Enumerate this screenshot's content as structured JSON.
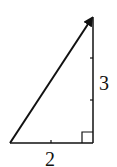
{
  "diagram": {
    "type": "right-triangle-vector",
    "colors": {
      "stroke": "#111111",
      "background": "#ffffff"
    },
    "horizontal_leg": {
      "label": "2"
    },
    "vertical_leg": {
      "label": "3"
    },
    "hypotenuse": {
      "arrow": "tip at top-right"
    },
    "right_angle_marker": "bottom-right"
  }
}
